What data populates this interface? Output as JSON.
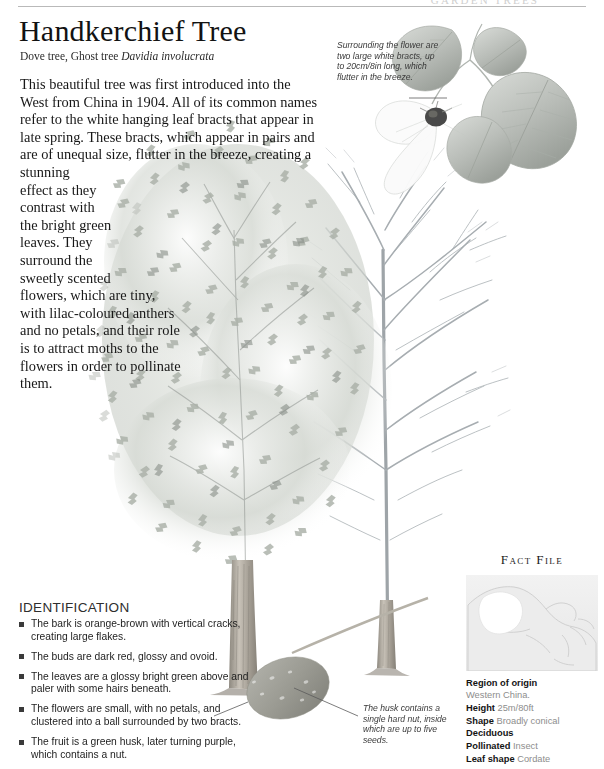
{
  "running_head": "GARDEN TREES",
  "header": {
    "title": "Handkerchief Tree",
    "common_names": "Dove tree, Ghost tree ",
    "scientific_name": "Davidia involucrata"
  },
  "intro": {
    "body": "This beautiful tree was first introduced into the West from China in 1904. All of its common names refer to the white hanging leaf bracts that appear in late spring. These bracts, which appear in pairs and are of unequal size, flutter in the breeze, creating a stunning effect as they contrast with the bright green leaves. They surround the sweetly scented flowers, which are tiny, with lilac-coloured anthers and no petals, and their role is to attract moths to the flowers in order to pollinate them."
  },
  "callouts": {
    "bract": "Surrounding the flower are two large white bracts, up to 20cm/8in long, which flutter in the breeze.",
    "husk": "The husk contains a single hard nut, inside which are up to five seeds."
  },
  "identification": {
    "heading": "IDENTIFICATION",
    "items": [
      "The bark is orange-brown with vertical cracks, creating large flakes.",
      "The buds are dark red, glossy and ovoid.",
      "The leaves are a glossy bright green above and paler with some hairs beneath.",
      "The flowers are small, with no petals, and clustered into a ball surrounded by two bracts.",
      "The fruit is a green husk, later turning purple, which contains a nut."
    ]
  },
  "fact_file": {
    "heading": "Fact File",
    "rows": [
      {
        "label": "Region of origin",
        "value": "Western China."
      },
      {
        "label": "Height",
        "value": "25m/80ft"
      },
      {
        "label": "Shape",
        "value": "Broadly conical"
      },
      {
        "label": "Deciduous",
        "value": ""
      },
      {
        "label": "Pollinated",
        "value": "Insect"
      },
      {
        "label": "Leaf shape",
        "value": "Cordate"
      }
    ]
  },
  "colors": {
    "page_background": "#ffffff",
    "title_text": "#121212",
    "body_text": "#171717",
    "caption_text": "#3a3a3a",
    "fact_value_text": "#8d8d8d",
    "rule": "#b9b9b9",
    "foliage_mid": "#b8bcb6",
    "foliage_dark": "#8d928c",
    "trunk": "#9a958d",
    "branch": "#9aa0a4"
  }
}
